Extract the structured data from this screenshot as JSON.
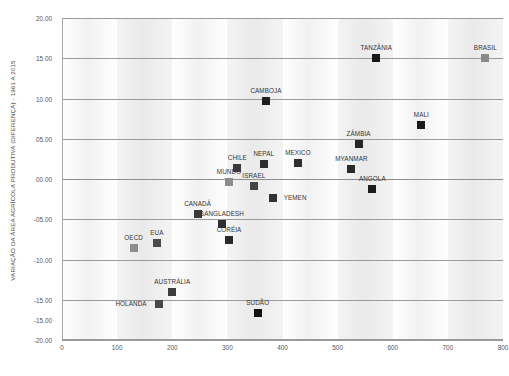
{
  "chart_data": {
    "type": "scatter",
    "title": "",
    "ylabel": "VARIAÇÃO DA ÁREA AGRÍCOLA PRODUTIVA (DIFERENÇA) - 1961 A 2015",
    "xlabel": "",
    "xlim": [
      0,
      800
    ],
    "ylim": [
      -20,
      20
    ],
    "xticks": [
      "0",
      "100",
      "200",
      "300",
      "400",
      "500",
      "600",
      "700",
      "800"
    ],
    "xtick_values": [
      0,
      100,
      200,
      300,
      400,
      500,
      600,
      700,
      800
    ],
    "yticks": [
      "20.00",
      "15.00",
      "10.00",
      "05.00",
      "00.00",
      "-05.00",
      "-10.00",
      "-15.00",
      "-15.00",
      "-20.00"
    ],
    "ytick_values": [
      20,
      15,
      10,
      5,
      0,
      -5,
      -10,
      -15,
      -17.5,
      -20
    ],
    "grid": "horizontal",
    "legend": "none",
    "background_bands": "alternating vertical gray stripes",
    "points": [
      {
        "label": "OECD",
        "x": 130,
        "y": -8.6,
        "color": "#8d8d8d",
        "label_dx": 0,
        "label_dy": -7
      },
      {
        "label": "EUA",
        "x": 172,
        "y": -7.9,
        "color": "#4a4a4a",
        "label_dx": 0,
        "label_dy": -7
      },
      {
        "label": "HOLANDA",
        "x": 176,
        "y": -15.5,
        "color": "#474747",
        "label_dx": -28,
        "label_dy": 3
      },
      {
        "label": "AUSTRÁLIA",
        "x": 200,
        "y": -14.0,
        "color": "#3c3c3c",
        "label_dx": 0,
        "label_dy": -7
      },
      {
        "label": "CANADÁ",
        "x": 246,
        "y": -4.3,
        "color": "#3a3a3a",
        "label_dx": 0,
        "label_dy": -7
      },
      {
        "label": "BANGLADESH",
        "x": 290,
        "y": -5.6,
        "color": "#303030",
        "label_dx": 0,
        "label_dy": -7
      },
      {
        "label": "MUNDO",
        "x": 303,
        "y": -0.4,
        "color": "#8d8d8d",
        "label_dx": 0,
        "label_dy": -7
      },
      {
        "label": "CORÉIA",
        "x": 303,
        "y": -7.6,
        "color": "#2b2b2b",
        "label_dx": 0,
        "label_dy": -7
      },
      {
        "label": "CHILE",
        "x": 318,
        "y": 1.4,
        "color": "#3a3a3a",
        "label_dx": 0,
        "label_dy": -7
      },
      {
        "label": "ISRAEL",
        "x": 348,
        "y": -0.9,
        "color": "#454545",
        "label_dx": 0,
        "label_dy": -7
      },
      {
        "label": "SUDÃO",
        "x": 355,
        "y": -16.6,
        "color": "#111111",
        "label_dx": 0,
        "label_dy": -7
      },
      {
        "label": "NEPAL",
        "x": 366,
        "y": 1.9,
        "color": "#2e2e2e",
        "label_dx": 0,
        "label_dy": -7
      },
      {
        "label": "CAMBOJA",
        "x": 370,
        "y": 9.7,
        "color": "#1e1e1e",
        "label_dx": 0,
        "label_dy": -7
      },
      {
        "label": "YEMEN",
        "x": 383,
        "y": -2.3,
        "color": "#333333",
        "label_dx": 22,
        "label_dy": 3
      },
      {
        "label": "MEXICO",
        "x": 428,
        "y": 2.0,
        "color": "#2f2f2f",
        "label_dx": 0,
        "label_dy": -7
      },
      {
        "label": "MYANMAR",
        "x": 525,
        "y": 1.3,
        "color": "#2a2a2a",
        "label_dx": 0,
        "label_dy": -7
      },
      {
        "label": "ZÂMBIA",
        "x": 538,
        "y": 4.4,
        "color": "#262626",
        "label_dx": 0,
        "label_dy": -7
      },
      {
        "label": "ANGOLA",
        "x": 563,
        "y": -1.2,
        "color": "#1c1c1c",
        "label_dx": 0,
        "label_dy": -7
      },
      {
        "label": "TANZÂNIA",
        "x": 570,
        "y": 15.0,
        "color": "#191919",
        "label_dx": 0,
        "label_dy": -7
      },
      {
        "label": "MALI",
        "x": 652,
        "y": 6.7,
        "color": "#1a1a1a",
        "label_dx": 0,
        "label_dy": -7
      },
      {
        "label": "BRASIL",
        "x": 768,
        "y": 15.0,
        "color": "#8a8a8a",
        "label_dx": 0,
        "label_dy": -7
      }
    ]
  }
}
